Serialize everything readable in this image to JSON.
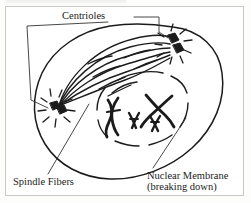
{
  "figure": {
    "kind": "biology-diagram",
    "background_color": "#ffffff",
    "ink_color": "#1b1b1b",
    "frame_color": "#c9c9c9"
  },
  "labels": {
    "centrioles": "Centrioles",
    "spindle_fibers": "Spindle Fibers",
    "nuclear_membrane_line1": "Nuclear Membrane",
    "nuclear_membrane_line2": "(breaking down)"
  },
  "structures": {
    "cell_membrane": "cell-membrane-outline",
    "nuclear_membrane": "nuclear-membrane-broken-arcs",
    "centriole_pair_left": "centriole-pair-left",
    "centriole_pair_right": "centriole-pair-right",
    "spindle_fibers": "spindle-fiber-bundle",
    "chromosomes": "chromosomes-x-shaped",
    "chromosome_count": 4
  },
  "leaders": {
    "centrioles_bracket": "bracket-to-both-centrioles",
    "spindle_leader": "line-to-spindle-bundle",
    "nuclear_leader": "line-to-nuclear-membrane"
  }
}
